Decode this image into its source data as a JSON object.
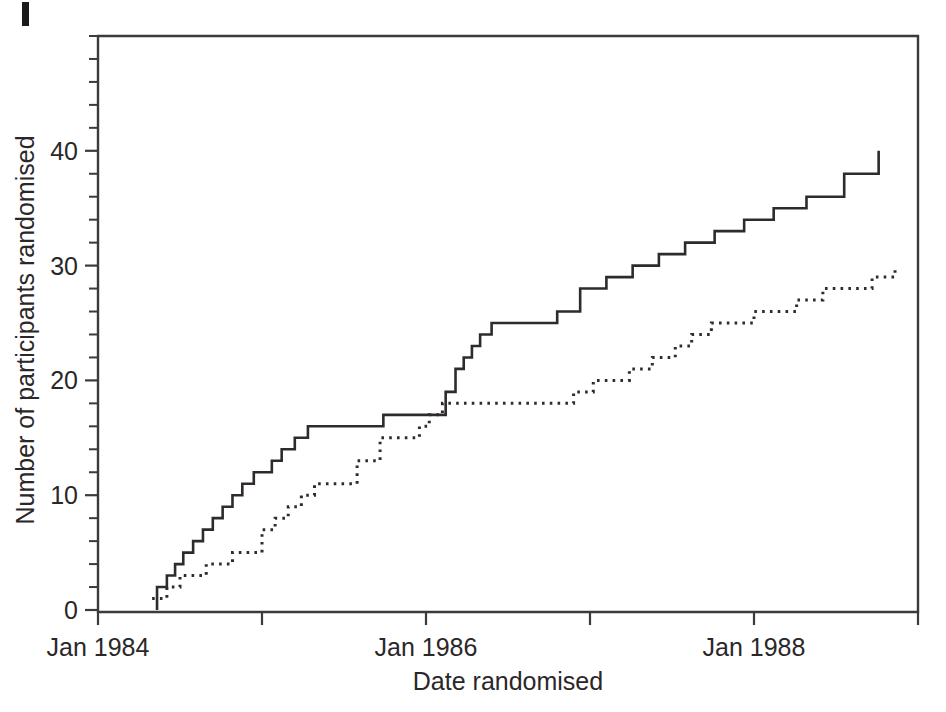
{
  "figure": {
    "background_color": "#ffffff",
    "ink_color": "#2b2729",
    "corner_mark": "page-edge-artifact"
  },
  "chart_data": {
    "type": "line",
    "title": "",
    "subtitle": "",
    "xlabel": "Date randomised",
    "ylabel": "Number of participants randomised",
    "grid": false,
    "legend_position": "none",
    "x_axis": {
      "type": "date",
      "unit": "years since Jan 1984",
      "xlim": [
        0,
        5.0
      ],
      "major_tick_values": [
        0,
        1,
        2,
        3,
        4,
        5
      ],
      "tick_labels": [
        "Jan 1984",
        "",
        "Jan 1986",
        "",
        "Jan 1988",
        ""
      ],
      "labeled_ticks": [
        {
          "value": 0,
          "label": "Jan 1984"
        },
        {
          "value": 2,
          "label": "Jan 1986"
        },
        {
          "value": 4,
          "label": "Jan 1988"
        }
      ]
    },
    "y_axis": {
      "ylim": [
        0,
        50
      ],
      "major_tick_values": [
        0,
        10,
        20,
        30,
        40
      ],
      "tick_labels": [
        "0",
        "10",
        "20",
        "30",
        "40"
      ],
      "minor_tick_interval": 2
    },
    "series": [
      {
        "name": "solid-cumulative-recruitment",
        "style": "solid",
        "line_color": "#2f2b2c",
        "step": "post",
        "final_value": 40,
        "x": [
          0.36,
          0.36,
          0.42,
          0.47,
          0.52,
          0.58,
          0.64,
          0.7,
          0.76,
          0.82,
          0.88,
          0.95,
          1.0,
          1.06,
          1.12,
          1.2,
          1.28,
          1.38,
          1.5,
          1.62,
          1.74,
          1.88,
          2.02,
          2.12,
          2.18,
          2.23,
          2.28,
          2.33,
          2.4,
          2.52,
          2.66,
          2.8,
          2.94,
          3.1,
          3.26,
          3.42,
          3.58,
          3.76,
          3.94,
          4.12,
          4.32,
          4.55,
          4.76,
          4.76
        ],
        "y": [
          0,
          2,
          3,
          4,
          5,
          6,
          7,
          8,
          9,
          10,
          11,
          12,
          12,
          13,
          14,
          15,
          16,
          16,
          16,
          16,
          17,
          17,
          17,
          19,
          21,
          22,
          23,
          24,
          25,
          25,
          25,
          26,
          28,
          29,
          30,
          31,
          32,
          33,
          34,
          35,
          36,
          38,
          39,
          40
        ]
      },
      {
        "name": "dashed-cumulative-recruitment",
        "style": "dashed",
        "line_color": "#2f2b2c",
        "step": "post",
        "final_value": 30,
        "x": [
          0.33,
          0.36,
          0.42,
          0.5,
          0.58,
          0.66,
          0.74,
          0.82,
          0.92,
          1.0,
          1.08,
          1.16,
          1.24,
          1.32,
          1.44,
          1.58,
          1.72,
          1.86,
          1.96,
          2.02,
          2.1,
          2.3,
          2.52,
          2.74,
          2.9,
          3.02,
          3.12,
          3.24,
          3.38,
          3.52,
          3.62,
          3.74,
          3.88,
          4.0,
          4.12,
          4.26,
          4.42,
          4.58,
          4.72,
          4.86,
          4.86
        ],
        "y": [
          1,
          1,
          2,
          3,
          3,
          4,
          4,
          5,
          5,
          7,
          8,
          9,
          10,
          11,
          11,
          13,
          15,
          15,
          16,
          17,
          18,
          18,
          18,
          18,
          19,
          20,
          20,
          21,
          22,
          23,
          24,
          25,
          25,
          26,
          26,
          27,
          28,
          28,
          29,
          29,
          30
        ]
      }
    ]
  }
}
